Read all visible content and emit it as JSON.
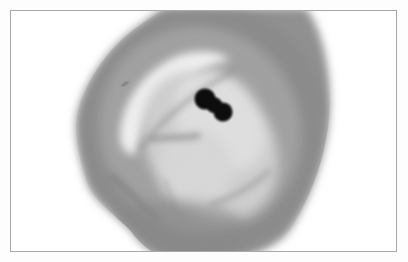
{
  "image": {
    "description": "Grayscale light-microscopy photograph of a single cell with a bilobed dark nucleus",
    "subject": "cell",
    "features": [
      "outer gray cytoplasm halo",
      "pale inner vacuole region",
      "bilobed dark nucleus",
      "fibrous mottled lower body"
    ]
  },
  "colors": {
    "background": "#ffffff",
    "frame_border": "#a8a8a8",
    "outer_halo": "#8a8a8a",
    "halo_mid": "#a3a3a3",
    "inner_pale": "#e4e4e4",
    "inner_body": "#c6c6c6",
    "nucleus": "#080808"
  }
}
